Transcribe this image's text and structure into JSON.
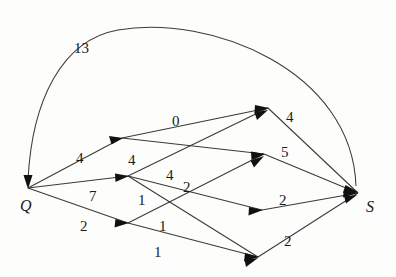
{
  "figure": {
    "title": "",
    "type": "directed-weighted-graph",
    "background_color": "#fdfdfb",
    "stroke_color": "#3a3a38",
    "text_color": "#1a1a1a",
    "width": 396,
    "height": 277
  },
  "graph_data": {
    "type": "diagram",
    "directed": true,
    "weighted": true,
    "nodes": [
      {
        "id": "Q",
        "label": "Q",
        "x": 28,
        "y": 188,
        "label_x": 26,
        "label_y": 209,
        "labeled": true
      },
      {
        "id": "S",
        "label": "S",
        "x": 358,
        "y": 193,
        "label_x": 370,
        "label_y": 212,
        "labeled": true
      },
      {
        "id": "a",
        "label": "",
        "x": 122,
        "y": 138,
        "labeled": false
      },
      {
        "id": "b",
        "label": "",
        "x": 128,
        "y": 176,
        "labeled": false
      },
      {
        "id": "c",
        "label": "",
        "x": 128,
        "y": 223,
        "labeled": false
      },
      {
        "id": "d",
        "label": "",
        "x": 268,
        "y": 108,
        "labeled": false
      },
      {
        "id": "e",
        "label": "",
        "x": 264,
        "y": 154,
        "labeled": false
      },
      {
        "id": "f",
        "label": "",
        "x": 262,
        "y": 210,
        "labeled": false
      },
      {
        "id": "g",
        "label": "",
        "x": 258,
        "y": 257,
        "labeled": false
      }
    ],
    "edges": [
      {
        "from": "S",
        "to": "Q",
        "weight": "13",
        "shape": "arc",
        "label_x": 88,
        "label_y": 48
      },
      {
        "from": "Q",
        "to": "a",
        "weight": "4",
        "shape": "line",
        "label_x": 82,
        "label_y": 160
      },
      {
        "from": "Q",
        "to": "b",
        "weight": "7",
        "shape": "line",
        "label_x": 93,
        "label_y": 198
      },
      {
        "from": "Q",
        "to": "c",
        "weight": "2",
        "shape": "line",
        "label_x": 86,
        "label_y": 228
      },
      {
        "from": "a",
        "to": "d",
        "weight": "0",
        "shape": "line",
        "label_x": 178,
        "label_y": 122
      },
      {
        "from": "a",
        "to": "e",
        "weight": "4",
        "shape": "line",
        "label_x": 133,
        "label_y": 160
      },
      {
        "from": "b",
        "to": "d",
        "weight": "4",
        "shape": "line",
        "label_x": 170,
        "label_y": 175
      },
      {
        "from": "b",
        "to": "f",
        "weight": "2",
        "shape": "line",
        "label_x": 187,
        "label_y": 188
      },
      {
        "from": "b",
        "to": "g",
        "weight": "1",
        "shape": "line",
        "label_x": 142,
        "label_y": 200
      },
      {
        "from": "c",
        "to": "e",
        "weight": "1",
        "shape": "line",
        "label_x": 163,
        "label_y": 227
      },
      {
        "from": "c",
        "to": "g",
        "weight": "1",
        "shape": "line",
        "label_x": 158,
        "label_y": 253
      },
      {
        "from": "d",
        "to": "S",
        "weight": "4",
        "shape": "line",
        "label_x": 290,
        "label_y": 117
      },
      {
        "from": "e",
        "to": "S",
        "weight": "5",
        "shape": "line",
        "label_x": 285,
        "label_y": 152
      },
      {
        "from": "f",
        "to": "S",
        "weight": "2",
        "shape": "line",
        "label_x": 283,
        "label_y": 200
      },
      {
        "from": "g",
        "to": "S",
        "weight": "2",
        "shape": "line",
        "label_x": 288,
        "label_y": 241
      }
    ],
    "arc_path": "M 356 186 C 352 70 210 14 118 30 C 62 40 32 100 28 180",
    "segments": [
      {
        "x1": 28,
        "y1": 188,
        "x2": 122,
        "y2": 138
      },
      {
        "x1": 28,
        "y1": 188,
        "x2": 128,
        "y2": 176
      },
      {
        "x1": 28,
        "y1": 188,
        "x2": 128,
        "y2": 223
      },
      {
        "x1": 122,
        "y1": 138,
        "x2": 268,
        "y2": 108
      },
      {
        "x1": 122,
        "y1": 138,
        "x2": 264,
        "y2": 154
      },
      {
        "x1": 128,
        "y1": 176,
        "x2": 268,
        "y2": 108
      },
      {
        "x1": 128,
        "y1": 176,
        "x2": 262,
        "y2": 210
      },
      {
        "x1": 128,
        "y1": 176,
        "x2": 258,
        "y2": 257
      },
      {
        "x1": 128,
        "y1": 223,
        "x2": 264,
        "y2": 154
      },
      {
        "x1": 128,
        "y1": 223,
        "x2": 258,
        "y2": 257
      },
      {
        "x1": 268,
        "y1": 108,
        "x2": 358,
        "y2": 193
      },
      {
        "x1": 264,
        "y1": 154,
        "x2": 358,
        "y2": 193
      },
      {
        "x1": 262,
        "y1": 210,
        "x2": 358,
        "y2": 193
      },
      {
        "x1": 258,
        "y1": 257,
        "x2": 358,
        "y2": 193
      }
    ]
  }
}
